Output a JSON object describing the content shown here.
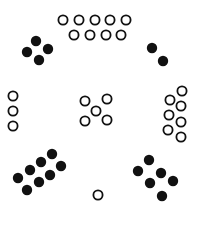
{
  "diagram": {
    "background": "#ffffff",
    "ink": "#111111",
    "dot_radius": 5.2,
    "ring_radius": 4.6,
    "ring_stroke": 1.8,
    "groups": [
      {
        "name": "top-arc-open-circles",
        "style": "open",
        "count": 9,
        "points": [
          [
            63,
            20
          ],
          [
            79,
            20
          ],
          [
            95,
            20
          ],
          [
            110,
            20
          ],
          [
            126,
            20
          ],
          [
            74,
            35
          ],
          [
            90,
            35
          ],
          [
            106,
            35
          ],
          [
            121,
            35
          ]
        ]
      },
      {
        "name": "upper-left-filled-dots",
        "style": "filled",
        "count": 4,
        "points": [
          [
            36,
            41
          ],
          [
            48,
            49
          ],
          [
            27,
            52
          ],
          [
            39,
            60
          ]
        ]
      },
      {
        "name": "upper-right-filled-dots",
        "style": "filled",
        "count": 2,
        "points": [
          [
            152,
            48
          ],
          [
            163,
            61
          ]
        ]
      },
      {
        "name": "left-column-open-circles",
        "style": "open",
        "count": 3,
        "points": [
          [
            13,
            96
          ],
          [
            13,
            111
          ],
          [
            13,
            126
          ]
        ]
      },
      {
        "name": "center-quincunx-open-circles",
        "style": "open",
        "count": 5,
        "points": [
          [
            85,
            101
          ],
          [
            107,
            99
          ],
          [
            96,
            111
          ],
          [
            85,
            121
          ],
          [
            107,
            120
          ]
        ]
      },
      {
        "name": "right-cluster-open-circles",
        "style": "open",
        "count": 7,
        "points": [
          [
            182,
            91
          ],
          [
            170,
            100
          ],
          [
            181,
            106
          ],
          [
            169,
            115
          ],
          [
            181,
            122
          ],
          [
            168,
            130
          ],
          [
            181,
            137
          ]
        ]
      },
      {
        "name": "lower-left-filled-dots",
        "style": "filled",
        "count": 8,
        "points": [
          [
            18,
            178
          ],
          [
            30,
            170
          ],
          [
            41,
            162
          ],
          [
            52,
            154
          ],
          [
            27,
            190
          ],
          [
            39,
            182
          ],
          [
            50,
            175
          ],
          [
            61,
            166
          ]
        ]
      },
      {
        "name": "bottom-center-open-circle",
        "style": "open",
        "count": 1,
        "points": [
          [
            98,
            195
          ]
        ]
      },
      {
        "name": "lower-right-filled-dots",
        "style": "filled",
        "count": 6,
        "points": [
          [
            149,
            160
          ],
          [
            138,
            171
          ],
          [
            161,
            173
          ],
          [
            150,
            183
          ],
          [
            173,
            181
          ],
          [
            162,
            196
          ]
        ]
      }
    ]
  }
}
